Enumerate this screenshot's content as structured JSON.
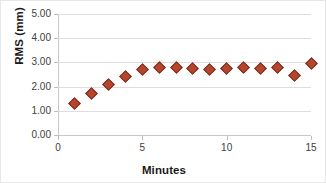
{
  "chart_data": {
    "type": "scatter",
    "title": "",
    "xlabel": "Minutes",
    "ylabel": "RMS (mm)",
    "xlim": [
      0,
      15
    ],
    "ylim": [
      0,
      5
    ],
    "xticks": [
      0,
      5,
      10,
      15
    ],
    "xtick_labels": [
      "0",
      "5",
      "10",
      "15"
    ],
    "yticks": [
      0,
      1,
      2,
      3,
      4,
      5
    ],
    "ytick_labels": [
      "0.00",
      "1.00",
      "2.00",
      "3.00",
      "4.00",
      "5.00"
    ],
    "grid": "horizontal",
    "legend": "none",
    "marker_shape": "diamond",
    "marker_color": "#b5462e",
    "marker_edge_color": "#7a2c1c",
    "gridline_color": "#dedede",
    "axis_color": "#c9c9c9",
    "x": [
      1,
      2,
      3,
      4,
      5,
      6,
      7,
      8,
      9,
      10,
      11,
      12,
      13,
      14,
      15
    ],
    "values": [
      1.3,
      1.72,
      2.1,
      2.42,
      2.7,
      2.78,
      2.77,
      2.73,
      2.7,
      2.74,
      2.79,
      2.74,
      2.79,
      2.45,
      2.95
    ],
    "series": [
      {
        "name": "RMS",
        "x": [
          1,
          2,
          3,
          4,
          5,
          6,
          7,
          8,
          9,
          10,
          11,
          12,
          13,
          14,
          15
        ],
        "values": [
          1.3,
          1.72,
          2.1,
          2.42,
          2.7,
          2.78,
          2.77,
          2.73,
          2.7,
          2.74,
          2.79,
          2.74,
          2.79,
          2.45,
          2.95
        ]
      }
    ]
  }
}
